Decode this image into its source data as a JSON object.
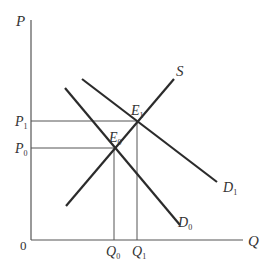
{
  "diagram": {
    "type": "supply-demand",
    "axes": {
      "y_label": "P",
      "x_label": "Q",
      "origin_label": "0"
    },
    "price_labels": [
      {
        "main": "P",
        "sub": "1"
      },
      {
        "main": "P",
        "sub": "0"
      }
    ],
    "quantity_labels": [
      {
        "main": "Q",
        "sub": "0"
      },
      {
        "main": "Q",
        "sub": "1"
      }
    ],
    "curves": [
      {
        "name": "S",
        "sub": ""
      },
      {
        "name": "D",
        "sub": "0"
      },
      {
        "name": "D",
        "sub": "1"
      }
    ],
    "equilibria": [
      {
        "main": "E",
        "sub": "0"
      },
      {
        "main": "E",
        "sub": "1"
      }
    ],
    "colors": {
      "line": "#2b2b2b",
      "axis": "#555555",
      "text": "#333333"
    }
  }
}
